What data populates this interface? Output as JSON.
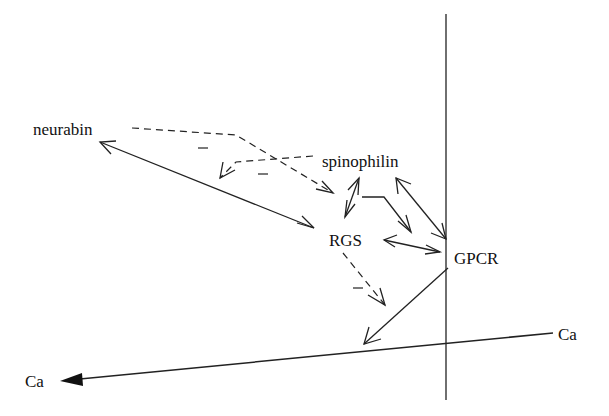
{
  "diagram": {
    "nodes": [
      {
        "id": "neurabin",
        "label": "neurabin",
        "x": 33,
        "y": 135
      },
      {
        "id": "spinophilin",
        "label": "spinophilin",
        "x": 322,
        "y": 167
      },
      {
        "id": "rgs",
        "label": "RGS",
        "x": 329,
        "y": 246
      },
      {
        "id": "gpcr",
        "label": "GPCR",
        "x": 454,
        "y": 264
      },
      {
        "id": "ca_right",
        "label": "Ca",
        "x": 558,
        "y": 340
      },
      {
        "id": "ca_left",
        "label": "Ca",
        "x": 25,
        "y": 387
      }
    ],
    "edges": [
      {
        "from": "neurabin",
        "to": "rgs",
        "style": "solid",
        "direction": "both"
      },
      {
        "from": "neurabin",
        "to": "rgs",
        "style": "dashed",
        "direction": "forward"
      },
      {
        "from": "spinophilin",
        "to": "neurabin-rgs-edge",
        "style": "dashed",
        "direction": "forward"
      },
      {
        "from": "spinophilin",
        "to": "rgs",
        "style": "solid",
        "direction": "both"
      },
      {
        "from": "spinophilin",
        "to": "gpcr",
        "style": "solid",
        "direction": "forward"
      },
      {
        "from": "spinophilin",
        "to": "gpcr",
        "style": "solid",
        "direction": "both"
      },
      {
        "from": "rgs",
        "to": "gpcr",
        "style": "solid",
        "direction": "both"
      },
      {
        "from": "rgs",
        "to": "gpcr-ca-edge",
        "style": "dashed",
        "direction": "forward"
      },
      {
        "from": "gpcr",
        "to": "ca-axis",
        "style": "solid",
        "direction": "forward"
      },
      {
        "from": "ca_right",
        "to": "ca_left",
        "style": "solid",
        "direction": "forward"
      }
    ],
    "signs": [
      "−",
      "−",
      "−"
    ],
    "axes": {
      "vertical_line": true,
      "ca_axis": true
    }
  }
}
